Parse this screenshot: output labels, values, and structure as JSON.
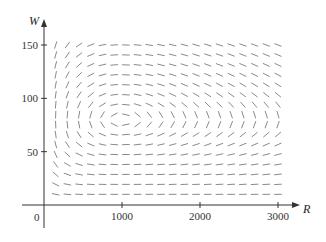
{
  "chart_data": {
    "type": "direction_field",
    "title": "",
    "xlabel": "R",
    "ylabel": "W",
    "origin_label": "0",
    "xlim": [
      0,
      3200
    ],
    "ylim": [
      0,
      160
    ],
    "x_ticks": [
      1000,
      2000,
      3000
    ],
    "x_tick_labels": [
      "1000",
      "2000",
      "3000"
    ],
    "y_ticks": [
      50,
      100,
      150
    ],
    "y_tick_labels": [
      "50",
      "100",
      "150"
    ],
    "grid": false,
    "legend": null,
    "field": {
      "model": "Lotka-Volterra predator-prey",
      "equilibrium": {
        "R": 1000,
        "W": 80
      },
      "R_range": [
        150,
        3000
      ],
      "W_range": [
        10,
        150
      ],
      "columns": 20,
      "rows": 16
    },
    "colors": {
      "axis": "#333333",
      "segment": "#8a8a8a",
      "background": "#ffffff"
    }
  }
}
